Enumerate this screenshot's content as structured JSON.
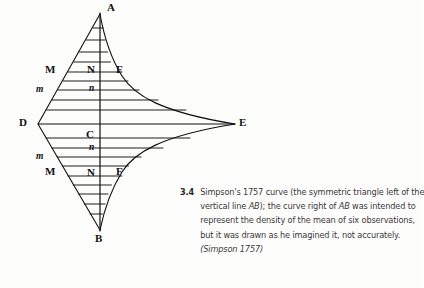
{
  "figure": {
    "number": "3.4",
    "caption_lines": [
      "Simpson's 1757 curve (the symmetric triangle left of the",
      "vertical line AB); the curve right of AB was intended to",
      "represent the density of the mean of six observations,",
      "but it was drawn as he imagined it, not accurately."
    ],
    "source": "(Simpson 1757)",
    "caption_full": "Simpson's 1757 curve (the symmetric triangle left of the vertical line AB); the curve right of AB was intended to represent the density of the mean of six observations, but it was drawn as he imagined it, not accurately. (Simpson 1757)"
  },
  "diagram": {
    "ink_color": "#111111",
    "background_color": "#fdfdfc",
    "points": [
      {
        "id": "A",
        "label": "A",
        "x": 100,
        "y": 14,
        "label_x": 107,
        "label_y": 2,
        "style": "bold-serif"
      },
      {
        "id": "B",
        "label": "B",
        "x": 100,
        "y": 230,
        "label_x": 95,
        "label_y": 234,
        "style": "bold-serif"
      },
      {
        "id": "C",
        "label": "C",
        "x": 100,
        "y": 124,
        "label_x": 86,
        "label_y": 129,
        "style": "bold-serif"
      },
      {
        "id": "D",
        "label": "D",
        "x": 38,
        "y": 124,
        "label_x": 19,
        "label_y": 117,
        "style": "bold-serif"
      },
      {
        "id": "E",
        "label": "E",
        "x": 235,
        "y": 124,
        "label_x": 239,
        "label_y": 117,
        "style": "bold-serif"
      },
      {
        "id": "M_upper",
        "label": "M",
        "x": 60,
        "y": 72,
        "label_x": 45,
        "label_y": 64,
        "style": "bold-serif"
      },
      {
        "id": "N_upper",
        "label": "N",
        "x": 100,
        "y": 72,
        "label_x": 87,
        "label_y": 64,
        "style": "bold-serif"
      },
      {
        "id": "F_upper",
        "label": "F",
        "x": 122,
        "y": 72,
        "label_x": 116,
        "label_y": 64,
        "style": "bold-serif"
      },
      {
        "id": "m_upper",
        "label": "m",
        "x": 53,
        "y": 90,
        "label_x": 36,
        "label_y": 83,
        "style": "italic-serif"
      },
      {
        "id": "n_upper",
        "label": "n",
        "x": 100,
        "y": 90,
        "label_x": 89,
        "label_y": 83,
        "style": "italic-serif"
      },
      {
        "id": "m_lower",
        "label": "m",
        "x": 53,
        "y": 157,
        "label_x": 36,
        "label_y": 150,
        "style": "italic-serif"
      },
      {
        "id": "n_lower",
        "label": "n",
        "x": 100,
        "y": 157,
        "label_x": 89,
        "label_y": 142,
        "style": "italic-serif"
      },
      {
        "id": "M_lower",
        "label": "M",
        "x": 60,
        "y": 176,
        "label_x": 45,
        "label_y": 166,
        "style": "bold-serif"
      },
      {
        "id": "N_lower",
        "label": "N",
        "x": 100,
        "y": 176,
        "label_x": 87,
        "label_y": 167,
        "style": "bold-serif"
      },
      {
        "id": "F_lower",
        "label": "F",
        "x": 122,
        "y": 176,
        "label_x": 116,
        "label_y": 166,
        "style": "bold-serif"
      }
    ],
    "hatch_line_ys": [
      28,
      40,
      52,
      62,
      72,
      81,
      90,
      100,
      110,
      124,
      138,
      148,
      157,
      166,
      176,
      185,
      194,
      204,
      214
    ],
    "axis_label": "AB"
  }
}
